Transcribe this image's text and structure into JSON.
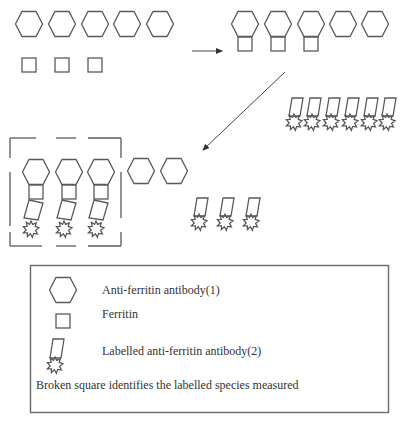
{
  "diagram": {
    "type": "sandwich immunoassay schematic",
    "steps": [
      {
        "name": "initial",
        "antibodies_1": 5,
        "ferritin": 3
      },
      {
        "name": "antibody-ferritin binding",
        "bound_complexes": 3,
        "free_antibodies_1": 5,
        "labelled_antibodies_2_added": 6
      },
      {
        "name": "sandwich formation",
        "sandwich_complexes_in_broken_square": 3,
        "free_antibodies_1": 2,
        "unbound_labelled_antibodies_2": 3
      }
    ],
    "arrows": [
      {
        "from": "step-1",
        "to": "step-2",
        "direction": "right"
      },
      {
        "from": "step-2",
        "to": "step-3",
        "direction": "down-left"
      }
    ]
  },
  "legend": {
    "items": [
      {
        "icon": "hexagon-icon",
        "label": "Anti-ferritin antibody(1)"
      },
      {
        "icon": "square-icon",
        "label": "Ferritin"
      },
      {
        "icon": "labelled-antibody-icon",
        "label": "Labelled anti-ferritin antibody(2)"
      }
    ],
    "note": "Broken square identifies the labelled species measured"
  },
  "colors": {
    "stroke": "#5a5a5a",
    "text": "#333333",
    "background": "#ffffff"
  }
}
